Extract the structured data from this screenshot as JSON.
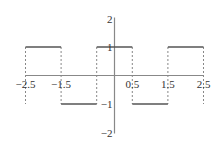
{
  "chart_data": {
    "type": "line",
    "title": "",
    "xlabel": "",
    "ylabel": "",
    "xlim": [
      -2.5,
      2.5
    ],
    "ylim": [
      -2,
      2
    ],
    "grid": false,
    "legend": null,
    "x_ticks": [
      -2.5,
      -1.5,
      0.5,
      1.5,
      2.5
    ],
    "x_tick_labels": [
      "-2.5",
      "-1.5",
      "0.5",
      "1.5",
      "2.5"
    ],
    "y_ticks": [
      2,
      1,
      -1,
      -2
    ],
    "y_tick_labels": [
      "2",
      "1",
      "-1",
      "-2"
    ],
    "series": [
      {
        "name": "square wave",
        "style": "solid",
        "segments": [
          {
            "x": [
              -2.5,
              -1.5
            ],
            "y": [
              1,
              1
            ]
          },
          {
            "x": [
              -1.5,
              -0.5
            ],
            "y": [
              -1,
              -1
            ]
          },
          {
            "x": [
              -0.5,
              0.5
            ],
            "y": [
              1,
              1
            ]
          },
          {
            "x": [
              0.5,
              1.5
            ],
            "y": [
              -1,
              -1
            ]
          },
          {
            "x": [
              1.5,
              2.5
            ],
            "y": [
              1,
              1
            ]
          }
        ]
      }
    ],
    "dashed_verticals": [
      {
        "x": -2.5,
        "y": [
          -1,
          1
        ]
      },
      {
        "x": -1.5,
        "y": [
          -1,
          1
        ]
      },
      {
        "x": -0.5,
        "y": [
          -1,
          1
        ]
      },
      {
        "x": 0.5,
        "y": [
          -1,
          1
        ]
      },
      {
        "x": 1.5,
        "y": [
          -1,
          1
        ]
      },
      {
        "x": 2.5,
        "y": [
          -1,
          1
        ]
      }
    ],
    "colors": {
      "curve": "#555555",
      "axis": "#888888",
      "dashed": "#888888",
      "labels": "#333333"
    }
  }
}
